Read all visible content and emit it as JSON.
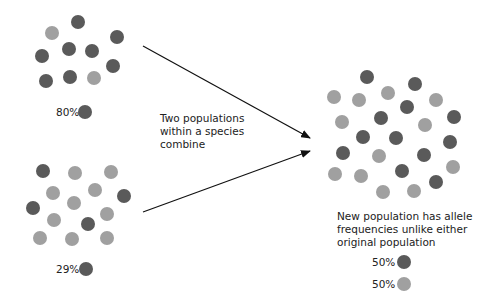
{
  "diagram": {
    "middle_caption": [
      "Two populations",
      "within a species",
      "combine"
    ],
    "result_caption": [
      "New population has allele",
      "frequencies unlike either",
      "original population"
    ],
    "colors": {
      "dark_allele": "#5a5a5a",
      "light_allele": "#a0a0a0"
    },
    "population_a": {
      "legend": [
        {
          "percent": "80%",
          "allele": "dark"
        }
      ],
      "dots": [
        {
          "x": 52,
          "y": 33,
          "c": "light"
        },
        {
          "x": 78,
          "y": 22,
          "c": "dark"
        },
        {
          "x": 117,
          "y": 37,
          "c": "dark"
        },
        {
          "x": 42,
          "y": 56,
          "c": "dark"
        },
        {
          "x": 69,
          "y": 49,
          "c": "dark"
        },
        {
          "x": 92,
          "y": 51,
          "c": "dark"
        },
        {
          "x": 113,
          "y": 66,
          "c": "dark"
        },
        {
          "x": 46,
          "y": 81,
          "c": "dark"
        },
        {
          "x": 70,
          "y": 77,
          "c": "dark"
        },
        {
          "x": 94,
          "y": 78,
          "c": "light"
        }
      ]
    },
    "population_b": {
      "legend": [
        {
          "percent": "29%",
          "allele": "dark"
        }
      ],
      "dots": [
        {
          "x": 43,
          "y": 171,
          "c": "dark"
        },
        {
          "x": 75,
          "y": 173,
          "c": "light"
        },
        {
          "x": 111,
          "y": 172,
          "c": "light"
        },
        {
          "x": 53,
          "y": 193,
          "c": "light"
        },
        {
          "x": 95,
          "y": 190,
          "c": "light"
        },
        {
          "x": 124,
          "y": 196,
          "c": "dark"
        },
        {
          "x": 33,
          "y": 208,
          "c": "dark"
        },
        {
          "x": 74,
          "y": 203,
          "c": "light"
        },
        {
          "x": 107,
          "y": 214,
          "c": "light"
        },
        {
          "x": 54,
          "y": 220,
          "c": "light"
        },
        {
          "x": 88,
          "y": 224,
          "c": "dark"
        },
        {
          "x": 40,
          "y": 238,
          "c": "light"
        },
        {
          "x": 72,
          "y": 239,
          "c": "light"
        },
        {
          "x": 107,
          "y": 238,
          "c": "light"
        }
      ]
    },
    "population_new": {
      "legend": [
        {
          "percent": "50%",
          "allele": "dark"
        },
        {
          "percent": "50%",
          "allele": "light"
        }
      ],
      "dots": [
        {
          "x": 367,
          "y": 77,
          "c": "dark"
        },
        {
          "x": 415,
          "y": 84,
          "c": "dark"
        },
        {
          "x": 334,
          "y": 97,
          "c": "light"
        },
        {
          "x": 359,
          "y": 100,
          "c": "light"
        },
        {
          "x": 388,
          "y": 93,
          "c": "light"
        },
        {
          "x": 407,
          "y": 107,
          "c": "dark"
        },
        {
          "x": 436,
          "y": 100,
          "c": "light"
        },
        {
          "x": 342,
          "y": 122,
          "c": "light"
        },
        {
          "x": 381,
          "y": 118,
          "c": "dark"
        },
        {
          "x": 425,
          "y": 125,
          "c": "light"
        },
        {
          "x": 454,
          "y": 117,
          "c": "dark"
        },
        {
          "x": 363,
          "y": 137,
          "c": "dark"
        },
        {
          "x": 396,
          "y": 138,
          "c": "dark"
        },
        {
          "x": 450,
          "y": 142,
          "c": "dark"
        },
        {
          "x": 343,
          "y": 153,
          "c": "dark"
        },
        {
          "x": 379,
          "y": 156,
          "c": "light"
        },
        {
          "x": 424,
          "y": 155,
          "c": "dark"
        },
        {
          "x": 335,
          "y": 174,
          "c": "light"
        },
        {
          "x": 361,
          "y": 176,
          "c": "light"
        },
        {
          "x": 402,
          "y": 171,
          "c": "dark"
        },
        {
          "x": 453,
          "y": 167,
          "c": "light"
        },
        {
          "x": 436,
          "y": 182,
          "c": "dark"
        },
        {
          "x": 383,
          "y": 192,
          "c": "light"
        },
        {
          "x": 414,
          "y": 191,
          "c": "light"
        }
      ]
    },
    "arrows": [
      {
        "x1": 143,
        "y1": 46,
        "x2": 310,
        "y2": 138
      },
      {
        "x1": 143,
        "y1": 212,
        "x2": 310,
        "y2": 151
      }
    ]
  }
}
